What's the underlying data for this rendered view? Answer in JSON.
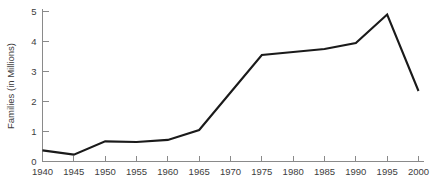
{
  "chart_data": {
    "type": "line",
    "title": "",
    "xlabel": "",
    "ylabel": "Families (in Millions)",
    "x": [
      1940,
      1945,
      1950,
      1955,
      1960,
      1965,
      1970,
      1975,
      1980,
      1985,
      1990,
      1995,
      2000
    ],
    "values": [
      0.37,
      0.23,
      0.67,
      0.65,
      0.72,
      1.05,
      2.3,
      3.55,
      3.65,
      3.75,
      3.95,
      4.9,
      2.35
    ],
    "series": [
      {
        "name": "Families",
        "values": [
          0.37,
          0.23,
          0.67,
          0.65,
          0.72,
          1.05,
          2.3,
          3.55,
          3.65,
          3.75,
          3.95,
          4.9,
          2.35
        ]
      }
    ],
    "xtick_labels": [
      "1940",
      "1945",
      "1950",
      "1955",
      "1960",
      "1965",
      "1970",
      "1975",
      "1980",
      "1985",
      "1990",
      "1995",
      "2000"
    ],
    "ytick_labels": [
      "0",
      "1",
      "2",
      "3",
      "4",
      "5"
    ],
    "ytick_values": [
      0,
      1,
      2,
      3,
      4,
      5
    ],
    "xlim": [
      1940,
      2000
    ],
    "ylim": [
      0,
      5
    ],
    "grid": false,
    "legend": false,
    "legend_position": "none",
    "line_color": "#1a1a1a",
    "axis_color": "#8a8a8a",
    "background_color": "#ffffff",
    "markers": false
  }
}
